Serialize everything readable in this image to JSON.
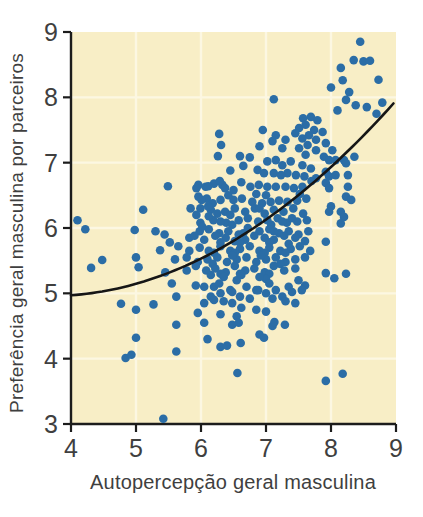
{
  "figure": {
    "page_background": "#ffffff",
    "plot_background": "#f8eec6",
    "grid_color": "#fcf7e2",
    "axis_color": "#1c1c1c",
    "dot_color": "#2b6da6",
    "curve_color": "#161616",
    "text_color": "#3f3f3f"
  },
  "chart_data": {
    "type": "scatter",
    "title": "",
    "xlabel": "Autopercepção geral masculina",
    "ylabel": "Preferência geral masculina por parceiros",
    "xlim": [
      4,
      9
    ],
    "ylim": [
      3,
      9
    ],
    "xticks": [
      4,
      5,
      6,
      7,
      8,
      9
    ],
    "yticks": [
      3,
      4,
      5,
      6,
      7,
      8,
      9
    ],
    "grid": true,
    "legend": false,
    "trend_curve": {
      "type": "quadratic",
      "equation": "y = 4.97 + 0.071*(x-4) + 0.105*(x-4)^2",
      "c0": 4.97,
      "c1": 0.071,
      "c2": 0.105,
      "x0": 4,
      "x_start": 4.0,
      "x_end": 8.97
    },
    "points": [
      [
        8.45,
        8.85
      ],
      [
        8.35,
        8.57
      ],
      [
        8.5,
        8.55
      ],
      [
        8.6,
        8.56
      ],
      [
        8.15,
        8.45
      ],
      [
        8.73,
        8.27
      ],
      [
        8.18,
        8.26
      ],
      [
        8.0,
        8.15
      ],
      [
        8.28,
        8.08
      ],
      [
        8.23,
        7.96
      ],
      [
        7.12,
        7.97
      ],
      [
        8.38,
        7.88
      ],
      [
        8.55,
        7.85
      ],
      [
        8.79,
        7.92
      ],
      [
        8.1,
        7.8
      ],
      [
        8.7,
        7.75
      ],
      [
        7.69,
        7.7
      ],
      [
        7.57,
        7.68
      ],
      [
        7.79,
        7.65
      ],
      [
        7.61,
        7.58
      ],
      [
        7.51,
        7.53
      ],
      [
        7.74,
        7.5
      ],
      [
        7.87,
        7.47
      ],
      [
        6.95,
        7.5
      ],
      [
        7.45,
        7.45
      ],
      [
        6.28,
        7.44
      ],
      [
        7.66,
        7.42
      ],
      [
        7.15,
        7.42
      ],
      [
        7.56,
        7.37
      ],
      [
        7.77,
        7.35
      ],
      [
        7.3,
        7.35
      ],
      [
        7.1,
        7.33
      ],
      [
        7.64,
        7.27
      ],
      [
        7.92,
        7.3
      ],
      [
        6.31,
        7.27
      ],
      [
        7.51,
        7.22
      ],
      [
        6.9,
        7.25
      ],
      [
        7.25,
        7.22
      ],
      [
        7.77,
        7.19
      ],
      [
        8.02,
        7.19
      ],
      [
        7.61,
        7.12
      ],
      [
        8.36,
        7.09
      ],
      [
        7.89,
        7.09
      ],
      [
        6.26,
        7.1
      ],
      [
        6.6,
        7.1
      ],
      [
        6.75,
        7.08
      ],
      [
        8.2,
        7.04
      ],
      [
        7.97,
        7.04
      ],
      [
        7.02,
        7.02
      ],
      [
        7.38,
        7.02
      ],
      [
        7.15,
        7.04
      ],
      [
        8.07,
        7.04
      ],
      [
        7.25,
        6.96
      ],
      [
        7.56,
        6.96
      ],
      [
        8.23,
        6.99
      ],
      [
        6.87,
        6.89
      ],
      [
        6.65,
        6.95
      ],
      [
        6.45,
        6.88
      ],
      [
        6.97,
        6.84
      ],
      [
        7.12,
        6.84
      ],
      [
        7.33,
        6.84
      ],
      [
        7.23,
        6.81
      ],
      [
        7.46,
        6.81
      ],
      [
        7.69,
        6.91
      ],
      [
        7.92,
        6.86
      ],
      [
        8.26,
        6.81
      ],
      [
        7.97,
        6.79
      ],
      [
        7.59,
        6.79
      ],
      [
        8.07,
        6.81
      ],
      [
        7.77,
        6.76
      ],
      [
        5.49,
        6.64
      ],
      [
        5.96,
        6.66
      ],
      [
        6.07,
        6.63
      ],
      [
        6.2,
        6.68
      ],
      [
        6.33,
        6.66
      ],
      [
        6.11,
        6.64
      ],
      [
        5.93,
        6.61
      ],
      [
        6.29,
        6.72
      ],
      [
        6.37,
        6.61
      ],
      [
        6.76,
        6.63
      ],
      [
        6.89,
        6.66
      ],
      [
        7.02,
        6.63
      ],
      [
        7.15,
        6.63
      ],
      [
        7.3,
        6.63
      ],
      [
        7.43,
        6.61
      ],
      [
        7.56,
        6.63
      ],
      [
        7.7,
        6.72
      ],
      [
        7.92,
        6.69
      ],
      [
        7.97,
        6.61
      ],
      [
        8.26,
        6.63
      ],
      [
        6.5,
        6.58
      ],
      [
        6.62,
        6.7
      ],
      [
        5.96,
        6.48
      ],
      [
        6.09,
        6.45
      ],
      [
        6.3,
        6.43
      ],
      [
        6.5,
        6.43
      ],
      [
        6.63,
        6.45
      ],
      [
        6.79,
        6.4
      ],
      [
        6.94,
        6.38
      ],
      [
        7.07,
        6.4
      ],
      [
        7.2,
        6.42
      ],
      [
        7.33,
        6.4
      ],
      [
        7.48,
        6.42
      ],
      [
        7.62,
        6.45
      ],
      [
        8.23,
        6.48
      ],
      [
        8.31,
        6.43
      ],
      [
        6.01,
        6.43
      ],
      [
        6.18,
        6.38
      ],
      [
        6.42,
        6.5
      ],
      [
        6.85,
        6.52
      ],
      [
        7.0,
        6.5
      ],
      [
        7.52,
        6.52
      ],
      [
        5.84,
        6.3
      ],
      [
        5.99,
        6.3
      ],
      [
        6.15,
        6.28
      ],
      [
        6.37,
        6.25
      ],
      [
        6.11,
        6.33
      ],
      [
        5.11,
        6.28
      ],
      [
        6.52,
        6.3
      ],
      [
        6.68,
        6.25
      ],
      [
        6.83,
        6.3
      ],
      [
        6.98,
        6.22
      ],
      [
        7.12,
        6.28
      ],
      [
        7.27,
        6.25
      ],
      [
        7.42,
        6.3
      ],
      [
        7.57,
        6.22
      ],
      [
        8.0,
        6.33
      ],
      [
        8.15,
        6.25
      ],
      [
        7.97,
        6.25
      ],
      [
        6.25,
        6.22
      ],
      [
        6.45,
        6.2
      ],
      [
        6.9,
        6.3
      ],
      [
        4.1,
        6.12
      ],
      [
        6.19,
        6.12
      ],
      [
        6.39,
        6.08
      ],
      [
        5.93,
        6.2
      ],
      [
        6.12,
        6.18
      ],
      [
        6.58,
        6.12
      ],
      [
        6.72,
        6.15
      ],
      [
        6.88,
        6.1
      ],
      [
        7.02,
        6.12
      ],
      [
        7.18,
        6.15
      ],
      [
        7.32,
        6.08
      ],
      [
        7.48,
        6.1
      ],
      [
        7.63,
        6.12
      ],
      [
        8.2,
        6.17
      ],
      [
        6.3,
        6.1
      ],
      [
        6.48,
        6.05
      ],
      [
        7.08,
        6.05
      ],
      [
        7.25,
        6.1
      ],
      [
        7.4,
        6.15
      ],
      [
        5.99,
        6.08
      ],
      [
        4.22,
        5.98
      ],
      [
        4.98,
        5.97
      ],
      [
        5.3,
        5.95
      ],
      [
        5.44,
        5.9
      ],
      [
        5.98,
        5.95
      ],
      [
        6.12,
        5.98
      ],
      [
        6.28,
        5.92
      ],
      [
        6.42,
        5.95
      ],
      [
        6.58,
        5.9
      ],
      [
        6.72,
        6.0
      ],
      [
        6.9,
        5.95
      ],
      [
        7.05,
        5.98
      ],
      [
        7.2,
        5.92
      ],
      [
        7.35,
        5.95
      ],
      [
        7.5,
        5.9
      ],
      [
        7.65,
        5.95
      ],
      [
        6.02,
        6.02
      ],
      [
        6.65,
        5.92
      ],
      [
        7.12,
        5.95
      ],
      [
        8.15,
        6.07
      ],
      [
        5.52,
        5.78
      ],
      [
        5.82,
        5.85
      ],
      [
        5.9,
        5.88
      ],
      [
        6.05,
        5.82
      ],
      [
        6.22,
        5.88
      ],
      [
        6.38,
        5.85
      ],
      [
        6.52,
        5.8
      ],
      [
        6.68,
        5.82
      ],
      [
        6.82,
        5.88
      ],
      [
        6.98,
        5.85
      ],
      [
        7.12,
        5.82
      ],
      [
        7.28,
        5.88
      ],
      [
        7.45,
        5.85
      ],
      [
        7.6,
        5.8
      ],
      [
        7.92,
        5.79
      ],
      [
        6.3,
        5.78
      ],
      [
        6.6,
        5.78
      ],
      [
        7.05,
        5.78
      ],
      [
        7.35,
        5.76
      ],
      [
        5.37,
        5.66
      ],
      [
        5.65,
        5.72
      ],
      [
        5.82,
        5.65
      ],
      [
        5.98,
        5.7
      ],
      [
        6.12,
        5.65
      ],
      [
        6.3,
        5.72
      ],
      [
        6.45,
        5.65
      ],
      [
        6.6,
        5.68
      ],
      [
        6.75,
        5.72
      ],
      [
        6.9,
        5.65
      ],
      [
        7.05,
        5.7
      ],
      [
        7.22,
        5.65
      ],
      [
        7.38,
        5.68
      ],
      [
        7.52,
        5.72
      ],
      [
        7.68,
        5.65
      ],
      [
        6.2,
        5.62
      ],
      [
        6.52,
        5.62
      ],
      [
        6.98,
        5.62
      ],
      [
        7.3,
        5.62
      ],
      [
        4.48,
        5.51
      ],
      [
        5.0,
        5.55
      ],
      [
        5.6,
        5.52
      ],
      [
        5.78,
        5.55
      ],
      [
        5.95,
        5.48
      ],
      [
        6.1,
        5.52
      ],
      [
        6.25,
        5.55
      ],
      [
        6.4,
        5.48
      ],
      [
        6.55,
        5.52
      ],
      [
        6.7,
        5.55
      ],
      [
        6.85,
        5.48
      ],
      [
        7.0,
        5.52
      ],
      [
        7.15,
        5.55
      ],
      [
        7.3,
        5.48
      ],
      [
        7.45,
        5.52
      ],
      [
        7.6,
        5.55
      ],
      [
        6.18,
        5.45
      ],
      [
        6.48,
        5.58
      ],
      [
        6.92,
        5.58
      ],
      [
        7.22,
        5.45
      ],
      [
        4.31,
        5.39
      ],
      [
        5.04,
        5.4
      ],
      [
        5.45,
        5.32
      ],
      [
        5.78,
        5.35
      ],
      [
        5.92,
        5.42
      ],
      [
        6.08,
        5.35
      ],
      [
        6.22,
        5.38
      ],
      [
        6.38,
        5.32
      ],
      [
        6.52,
        5.42
      ],
      [
        6.68,
        5.35
      ],
      [
        6.82,
        5.38
      ],
      [
        6.98,
        5.32
      ],
      [
        7.12,
        5.42
      ],
      [
        7.28,
        5.35
      ],
      [
        7.45,
        5.38
      ],
      [
        7.92,
        5.31
      ],
      [
        8.23,
        5.3
      ],
      [
        6.3,
        5.3
      ],
      [
        6.6,
        5.3
      ],
      [
        7.05,
        5.3
      ],
      [
        5.55,
        5.15
      ],
      [
        5.92,
        5.12
      ],
      [
        6.05,
        5.1
      ],
      [
        6.2,
        5.1
      ],
      [
        6.35,
        5.25
      ],
      [
        6.45,
        5.05
      ],
      [
        6.55,
        5.2
      ],
      [
        6.7,
        5.1
      ],
      [
        6.85,
        5.05
      ],
      [
        7.0,
        5.22
      ],
      [
        7.05,
        5.15
      ],
      [
        7.15,
        5.05
      ],
      [
        7.35,
        5.1
      ],
      [
        7.5,
        5.2
      ],
      [
        8.05,
        5.23
      ],
      [
        6.15,
        5.28
      ],
      [
        6.62,
        5.28
      ],
      [
        6.9,
        5.25
      ],
      [
        6.28,
        5.15
      ],
      [
        7.6,
        5.12
      ],
      [
        6.15,
        4.95
      ],
      [
        6.3,
        5.0
      ],
      [
        6.6,
        4.95
      ],
      [
        7.0,
        5.0
      ],
      [
        7.25,
        4.95
      ],
      [
        5.62,
        4.95
      ],
      [
        6.2,
        4.9
      ],
      [
        6.35,
        4.88
      ],
      [
        6.48,
        5.02
      ],
      [
        6.75,
        4.92
      ],
      [
        6.88,
        5.05
      ],
      [
        7.1,
        4.92
      ],
      [
        7.4,
        5.02
      ],
      [
        7.55,
        5.05
      ],
      [
        4.77,
        4.84
      ],
      [
        5.0,
        4.75
      ],
      [
        5.27,
        4.83
      ],
      [
        6.05,
        4.85
      ],
      [
        6.48,
        4.85
      ],
      [
        6.55,
        4.65
      ],
      [
        6.85,
        4.75
      ],
      [
        7.45,
        4.85
      ],
      [
        6.62,
        4.78
      ],
      [
        7.0,
        4.72
      ],
      [
        7.3,
        4.88
      ],
      [
        5.95,
        4.7
      ],
      [
        6.3,
        4.68
      ],
      [
        6.48,
        4.52
      ],
      [
        7.1,
        4.5
      ],
      [
        7.13,
        4.56
      ],
      [
        7.29,
        4.52
      ],
      [
        6.05,
        4.55
      ],
      [
        6.58,
        4.55
      ],
      [
        5.62,
        4.52
      ],
      [
        6.9,
        4.37
      ],
      [
        6.97,
        4.32
      ],
      [
        6.61,
        4.24
      ],
      [
        6.1,
        4.3
      ],
      [
        6.3,
        4.18
      ],
      [
        6.4,
        4.2
      ],
      [
        5.0,
        4.32
      ],
      [
        5.62,
        4.11
      ],
      [
        4.84,
        4.01
      ],
      [
        4.93,
        4.06
      ],
      [
        6.56,
        3.78
      ],
      [
        7.92,
        3.66
      ],
      [
        8.18,
        3.77
      ],
      [
        5.42,
        3.08
      ]
    ]
  }
}
